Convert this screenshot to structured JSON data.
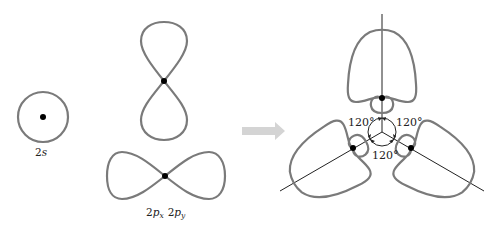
{
  "diagram": {
    "orbitals": {
      "s": {
        "label_main": "2",
        "label_italic": "s",
        "center": [
          43,
          117
        ],
        "radius": 25
      },
      "pz": {
        "center": [
          164,
          81
        ],
        "orientation": "vertical"
      },
      "px": {
        "center": [
          165,
          176
        ],
        "orientation": "horizontal"
      },
      "p_label": {
        "part1_main": "2",
        "part1_letter": "p",
        "part1_sub": "x",
        "part2_main": "2",
        "part2_letter": "p",
        "part2_sub": "y"
      }
    },
    "arrow": {
      "color": "#d4d4d4",
      "direction": "right"
    },
    "hybrid": {
      "center": [
        382,
        132
      ],
      "angles": [
        {
          "label": "120°",
          "position": "upper-left"
        },
        {
          "label": "120°",
          "position": "upper-right"
        },
        {
          "label": "120°",
          "position": "bottom"
        }
      ],
      "lobe_count": 3,
      "axis_directions_deg": [
        90,
        210,
        330
      ]
    },
    "colors": {
      "orbital_stroke": "#7a7a7a",
      "axis": "#222222",
      "nucleus": "#000000",
      "arrow": "#d4d4d4"
    }
  }
}
